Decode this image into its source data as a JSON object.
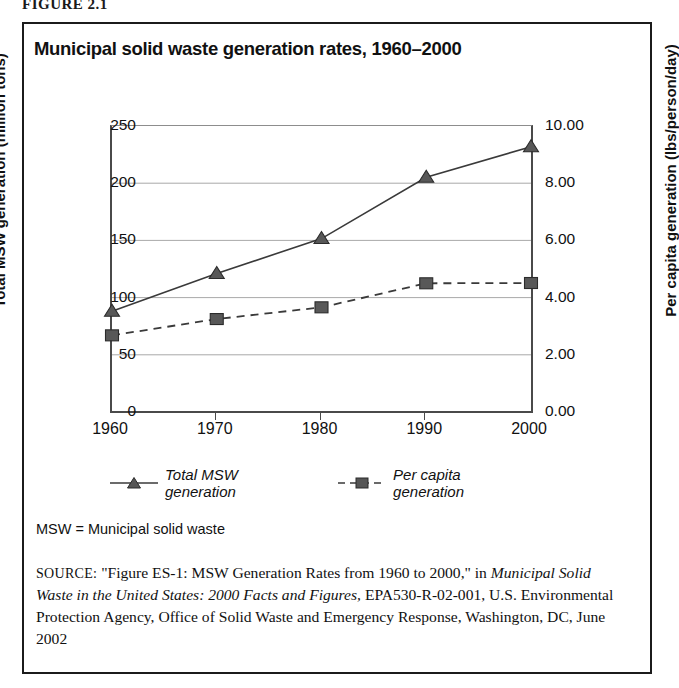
{
  "figure_label": "FIGURE 2.1",
  "chart_title": "Municipal solid waste generation rates, 1960–2000",
  "note": "MSW = Municipal solid waste",
  "source": {
    "prefix": "SOURCE:",
    "part1": " \"Figure ES-1: MSW Generation Rates from 1960 to 2000,\" in ",
    "italic_title": "Municipal Solid Waste in the United States: 2000 Facts and Figures,",
    "part2": " EPA530-R-02-001, U.S. Environmental Protection Agency, Office of Solid Waste and Emergency Response, Washington, DC, June 2002"
  },
  "chart_data": {
    "type": "line",
    "title": "Municipal solid waste generation rates, 1960–2000",
    "xlabel": "",
    "categories": [
      "1960",
      "1970",
      "1980",
      "1990",
      "2000"
    ],
    "x": [
      1960,
      1970,
      1980,
      1990,
      2000
    ],
    "grid": true,
    "legend_position": "bottom",
    "axes": {
      "left": {
        "label": "Total MSW generation (million tons)",
        "ticks": [
          "0",
          "50",
          "100",
          "150",
          "200",
          "250"
        ],
        "tickvalues": [
          0,
          50,
          100,
          150,
          200,
          250
        ],
        "ylim": [
          0,
          250
        ]
      },
      "right": {
        "label": "Per capita generation (lbs/person/day)",
        "ticks": [
          "0.00",
          "2.00",
          "4.00",
          "6.00",
          "8.00",
          "10.00"
        ],
        "tickvalues": [
          0,
          2,
          4,
          6,
          8,
          10
        ],
        "ylim": [
          0,
          10
        ]
      }
    },
    "series": [
      {
        "name": "Total MSW generation",
        "axis": "left",
        "marker": "triangle",
        "linestyle": "solid",
        "color": "#3a3a3a",
        "values": [
          88.1,
          121.1,
          151.6,
          205.2,
          231.9
        ]
      },
      {
        "name": "Per capita generation",
        "axis": "right",
        "marker": "square",
        "linestyle": "dashed",
        "color": "#3a3a3a",
        "values": [
          2.68,
          3.25,
          3.66,
          4.5,
          4.51
        ]
      }
    ]
  }
}
